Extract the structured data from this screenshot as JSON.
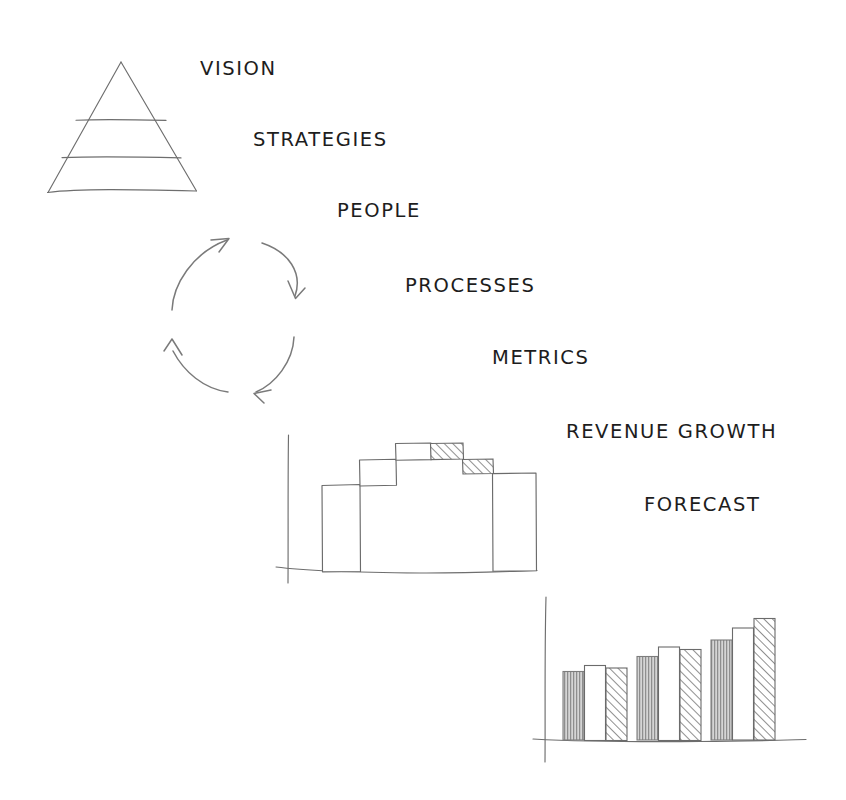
{
  "page": {
    "background_color": "#ffffff",
    "ink_color": "#6e6e6e",
    "text_color": "#1d1d1d",
    "width": 846,
    "height": 800
  },
  "labels": [
    {
      "id": "vision",
      "text": "VISION",
      "x": 200,
      "y": 75
    },
    {
      "id": "strategies",
      "text": "STRATEGIES",
      "x": 253,
      "y": 146
    },
    {
      "id": "people",
      "text": "PEOPLE",
      "x": 337,
      "y": 217
    },
    {
      "id": "processes",
      "text": "PROCESSES",
      "x": 405,
      "y": 292
    },
    {
      "id": "metrics",
      "text": "METRICS",
      "x": 492,
      "y": 364
    },
    {
      "id": "revenue_growth",
      "text": "REVENUE GROWTH",
      "x": 566,
      "y": 438
    },
    {
      "id": "forecast",
      "text": "FORECAST",
      "x": 644,
      "y": 511
    }
  ],
  "pyramid": {
    "name": "vision-pyramid",
    "levels": 3,
    "apex": {
      "x": 121,
      "y": 62
    },
    "base_left": {
      "x": 47,
      "y": 193
    },
    "base_right": {
      "x": 196,
      "y": 191
    },
    "divider_rows": [
      120,
      158
    ]
  },
  "cycle": {
    "name": "continuous-improvement-cycle",
    "center": {
      "x": 232,
      "y": 316
    },
    "radius": 62,
    "arrow_count": 4,
    "direction": "clockwise"
  },
  "chart_data": [
    {
      "id": "revenue-growth-waterfall",
      "type": "bar",
      "subtype": "waterfall",
      "title": "REVENUE GROWTH",
      "xlabel": "",
      "ylabel": "",
      "grid": false,
      "legend": false,
      "axis": {
        "y_axis_x": 288,
        "baseline_y": 570,
        "baseline_x_start": 276,
        "baseline_x_end": 537,
        "y_axis_top": 435,
        "y_axis_bottom": 583
      },
      "categories": [
        "Base",
        "Growth 1",
        "Growth 2",
        "Decline 1",
        "Decline 2",
        "Total"
      ],
      "segments": [
        {
          "label": "Base",
          "kind": "start",
          "fill": "white",
          "start": 0,
          "end": 56,
          "x": 322,
          "width": 38
        },
        {
          "label": "Growth 1",
          "kind": "increase",
          "fill": "white",
          "start": 56,
          "end": 81,
          "x": 360,
          "width": 36
        },
        {
          "label": "Growth 2",
          "kind": "increase",
          "fill": "white",
          "start": 81,
          "end": 97,
          "x": 396,
          "width": 35
        },
        {
          "label": "Decline 1",
          "kind": "decrease",
          "fill": "hatched",
          "start": 97,
          "end": 88,
          "x": 431,
          "width": 32
        },
        {
          "label": "Decline 2",
          "kind": "decrease",
          "fill": "hatched",
          "start": 88,
          "end": 79,
          "x": 463,
          "width": 30
        },
        {
          "label": "Total",
          "kind": "total",
          "fill": "white",
          "start": 0,
          "end": 79,
          "x": 493,
          "width": 43
        }
      ],
      "ylim": [
        0,
        110
      ]
    },
    {
      "id": "forecast-grouped-bars",
      "type": "bar",
      "subtype": "grouped",
      "title": "FORECAST",
      "xlabel": "",
      "ylabel": "",
      "grid": false,
      "legend": false,
      "axis": {
        "y_axis_x": 545,
        "baseline_y": 740,
        "baseline_x_start": 533,
        "baseline_x_end": 806,
        "y_axis_top": 597,
        "y_axis_bottom": 762
      },
      "categories": [
        "Period 1",
        "Period 2",
        "Period 3"
      ],
      "series": [
        {
          "name": "Actual",
          "fill": "vertical-hatch",
          "values": [
            68,
            83,
            99
          ]
        },
        {
          "name": "Plan",
          "fill": "white",
          "values": [
            74,
            92,
            111
          ]
        },
        {
          "name": "Forecast",
          "fill": "diagonal-hatch",
          "values": [
            72,
            90,
            120
          ]
        }
      ],
      "group_x": [
        563,
        637,
        711
      ],
      "bar_width": 21,
      "bar_gap": 1,
      "ylim": [
        0,
        145
      ]
    }
  ]
}
